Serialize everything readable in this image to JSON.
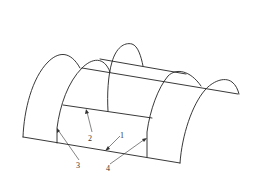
{
  "figure": {
    "type": "line-drawing",
    "stroke_color": "#222222",
    "background": "#ffffff"
  },
  "labels": [
    {
      "id": "1",
      "text": "1",
      "x": 122,
      "y": 138
    },
    {
      "id": "2",
      "text": "2",
      "x": 89,
      "y": 140
    },
    {
      "id": "3",
      "text": "3",
      "x": 76,
      "y": 168
    },
    {
      "id": "4",
      "text": "4",
      "x": 106,
      "y": 172
    }
  ]
}
